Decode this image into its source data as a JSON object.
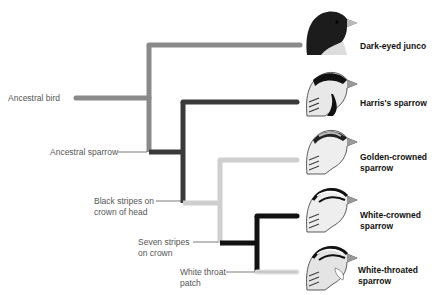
{
  "nodes": {
    "ancestral_bird": "Ancestral bird",
    "ancestral_sparrow": "Ancestral sparrow",
    "black_stripes": [
      "Black stripes on",
      "crown of head"
    ],
    "seven_stripes": [
      "Seven stripes",
      "on crown"
    ],
    "white_throat": [
      "White throat",
      "patch"
    ]
  },
  "species": [
    {
      "name": [
        "Dark-eyed junco"
      ],
      "icon": "junco-head-icon"
    },
    {
      "name": [
        "Harris's sparrow"
      ],
      "icon": "harris-sparrow-head-icon"
    },
    {
      "name": [
        "Golden-crowned",
        "sparrow"
      ],
      "icon": "golden-crowned-sparrow-head-icon"
    },
    {
      "name": [
        "White-crowned",
        "sparrow"
      ],
      "icon": "white-crowned-sparrow-head-icon"
    },
    {
      "name": [
        "White-throated",
        "sparrow"
      ],
      "icon": "white-throated-sparrow-head-icon"
    }
  ],
  "colors": {
    "branch_mid_gray": "#8a8a8a",
    "branch_dark": "#3a3a3a",
    "branch_black": "#111111",
    "branch_light": "#cfcfcf",
    "label_text": "#555555"
  }
}
